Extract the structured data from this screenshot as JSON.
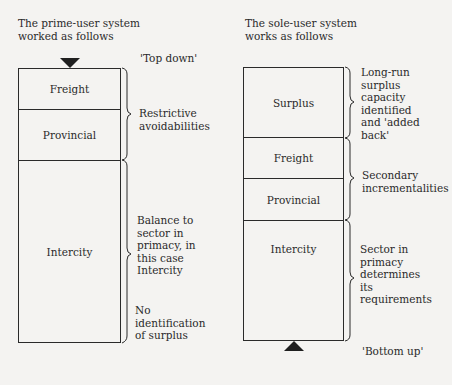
{
  "left": {
    "heading": [
      "The prime-user system",
      "worked as follows"
    ],
    "direction_label": "'Top down'",
    "segments": [
      {
        "label": "Freight"
      },
      {
        "label": "Provincial"
      },
      {
        "label": "Intercity"
      }
    ],
    "annotations": {
      "restrictive": [
        "Restrictive",
        "avoidabilities"
      ],
      "balance": [
        "Balance to",
        "sector in",
        "primacy, in",
        "this case",
        "Intercity"
      ],
      "no_surplus": [
        "No",
        "identification",
        "of surplus"
      ]
    }
  },
  "right": {
    "heading": [
      "The sole-user system",
      "works as follows"
    ],
    "direction_label": "'Bottom up'",
    "segments": [
      {
        "label": "Surplus"
      },
      {
        "label": "Freight"
      },
      {
        "label": "Provincial"
      },
      {
        "label": "Intercity"
      }
    ],
    "annotations": {
      "surplus": [
        "Long-run",
        "surplus",
        "capacity",
        "identified",
        "and 'added",
        "back'"
      ],
      "secondary": [
        "Secondary",
        "incrementalities"
      ],
      "sector": [
        "Sector in",
        "primacy",
        "determines",
        "its",
        "requirements"
      ]
    }
  }
}
